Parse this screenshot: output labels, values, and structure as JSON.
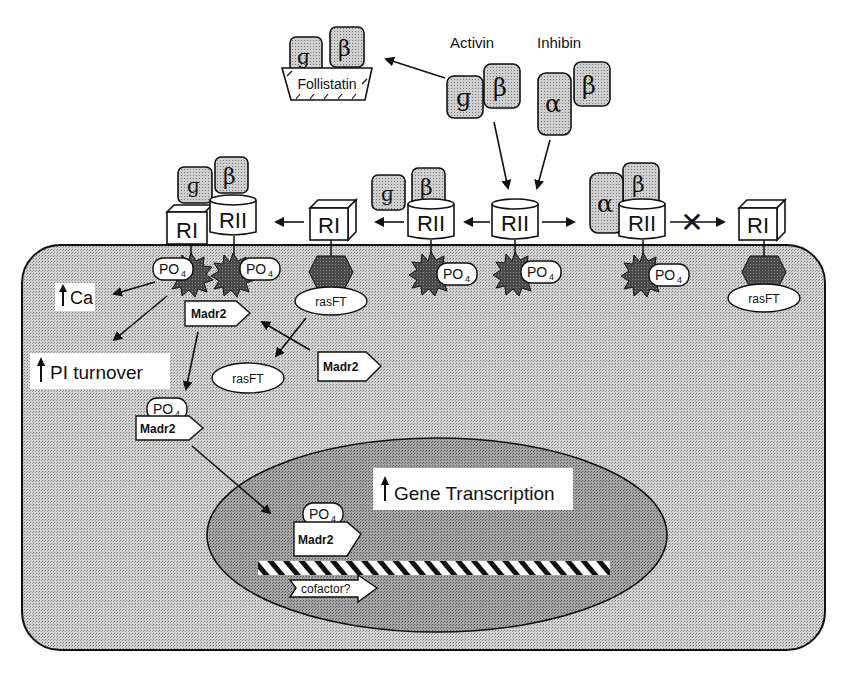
{
  "figure": {
    "type": "signaling-pathway-diagram"
  },
  "colors": {
    "cytoplasm": "#c4c4c4",
    "nucleus": "#9e9e9e",
    "ligand_fill": "#bdbdbd",
    "kinase_fill": "#3f3f3f",
    "line": "#111111",
    "background": "#ffffff"
  },
  "ligands": {
    "activin_label": "Activin",
    "inhibin_label": "Inhibin",
    "follistatin_label": "Follistatin",
    "beta_a_glyph": "β",
    "beta_b_glyph": "β",
    "alpha_glyph": "α",
    "beta_a_mark": "ɡ"
  },
  "receptors": {
    "type1_label": "RI",
    "type2_label": "RII"
  },
  "intracellular": {
    "phosphate_label": "PO",
    "phosphate_sub": "4",
    "madr2_label": "Madr2",
    "rasft_label": "rasFT"
  },
  "outputs": {
    "ca_label": "Ca",
    "pi_label": "PI turnover",
    "gene_label": "Gene Transcription",
    "cofactor_label": "cofactor?"
  },
  "blocked_symbol": "✕"
}
